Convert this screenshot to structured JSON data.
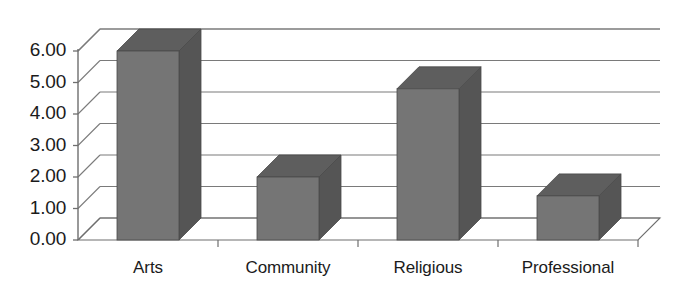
{
  "chart_data": {
    "type": "bar",
    "title": "",
    "subtitle": "",
    "xlabel": "",
    "ylabel": "",
    "categories": [
      "Arts",
      "Community",
      "Religious",
      "Professional"
    ],
    "values": [
      6.0,
      2.0,
      4.8,
      1.4
    ],
    "series": [
      {
        "name": "",
        "values": [
          6.0,
          2.0,
          4.8,
          1.4
        ]
      }
    ],
    "ylim": [
      0.0,
      6.0
    ],
    "ytick_labels": [
      "0.00",
      "1.00",
      "2.00",
      "3.00",
      "4.00",
      "5.00",
      "6.00"
    ],
    "ytick_values": [
      0,
      1,
      2,
      3,
      4,
      5,
      6
    ],
    "grid": true,
    "legend": "none",
    "projection": "3d",
    "colors": {
      "bar_front": "#757575",
      "bar_top": "#5e5e5e",
      "bar_side": "#555555",
      "grid_line": "#7a7a7a",
      "axis_line": "#6e6e6e",
      "background": "#ffffff",
      "text": "#1b1b1b"
    }
  }
}
